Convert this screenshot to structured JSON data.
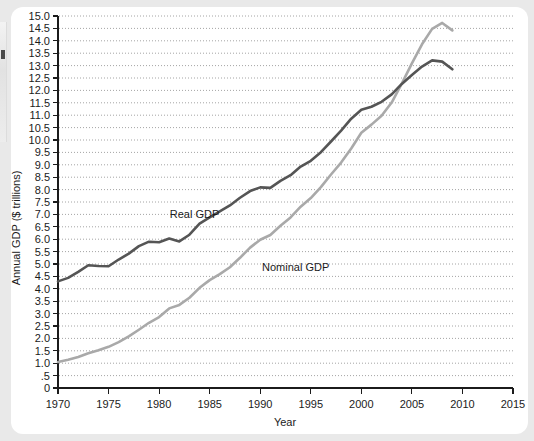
{
  "chart_data": {
    "type": "line",
    "title": "",
    "xlabel": "Year",
    "ylabel": "Annual GDP ($ trillions)",
    "xlim": [
      1970,
      2015
    ],
    "ylim": [
      0,
      15
    ],
    "grid": true,
    "legend_position": "inline-annotation",
    "x_ticks": [
      "1970",
      "1975",
      "1980",
      "1985",
      "1990",
      "1995",
      "2000",
      "2005",
      "2010",
      "2015"
    ],
    "y_ticks": [
      "0",
      ".5",
      "1.0",
      "1.5",
      "2.0",
      "2.5",
      "3.0",
      "3.5",
      "4.0",
      "4.5",
      "5.0",
      "5.5",
      "6.0",
      "6.5",
      "7.0",
      "7.5",
      "8.0",
      "8.5",
      "9.0",
      "9.5",
      "10.0",
      "10.5",
      "11.0",
      "11.5",
      "12.0",
      "12.5",
      "13.0",
      "13.5",
      "14.0",
      "14.5",
      "15.0"
    ],
    "x": [
      1970,
      1971,
      1972,
      1973,
      1974,
      1975,
      1976,
      1977,
      1978,
      1979,
      1980,
      1981,
      1982,
      1983,
      1984,
      1985,
      1986,
      1987,
      1988,
      1989,
      1990,
      1991,
      1992,
      1993,
      1994,
      1995,
      1996,
      1997,
      1998,
      1999,
      2000,
      2001,
      2002,
      2003,
      2004,
      2005,
      2006,
      2007,
      2008,
      2009
    ],
    "series": [
      {
        "name": "Real GDP",
        "color": "#555555",
        "label_x": 1983.5,
        "label_y": 6.85,
        "values": [
          4.3,
          4.44,
          4.68,
          4.95,
          4.92,
          4.91,
          5.18,
          5.42,
          5.72,
          5.9,
          5.88,
          6.03,
          5.91,
          6.18,
          6.63,
          6.88,
          7.12,
          7.36,
          7.67,
          7.94,
          8.09,
          8.07,
          8.35,
          8.58,
          8.93,
          9.16,
          9.51,
          9.94,
          10.38,
          10.86,
          11.22,
          11.34,
          11.54,
          11.84,
          12.26,
          12.62,
          12.96,
          13.21,
          13.16,
          12.85
        ],
        "last_value": 12.85
      },
      {
        "name": "Nominal GDP",
        "color": "#a9a9a9",
        "label_x": 1993.5,
        "label_y": 4.72,
        "values": [
          1.05,
          1.14,
          1.25,
          1.4,
          1.52,
          1.66,
          1.85,
          2.08,
          2.35,
          2.63,
          2.86,
          3.21,
          3.35,
          3.64,
          4.04,
          4.35,
          4.59,
          4.87,
          5.25,
          5.66,
          5.98,
          6.17,
          6.54,
          6.88,
          7.31,
          7.66,
          8.1,
          8.61,
          9.09,
          9.66,
          10.29,
          10.62,
          10.98,
          11.51,
          12.27,
          13.09,
          13.86,
          14.48,
          14.72,
          14.42
        ],
        "last_value": 14.42
      }
    ]
  }
}
